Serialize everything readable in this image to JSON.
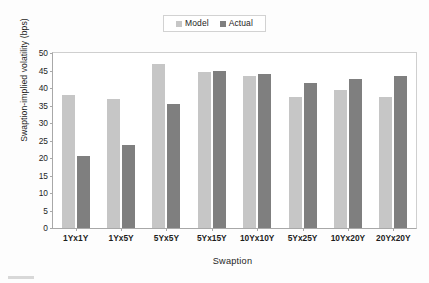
{
  "chart_data": {
    "type": "bar",
    "title": "",
    "xlabel": "Swaption",
    "ylabel": "Swaption-implied volatility (bps)",
    "categories": [
      "1Yx1Y",
      "1Yx5Y",
      "5Yx5Y",
      "5Yx15Y",
      "10Yx10Y",
      "5Yx25Y",
      "10Yx20Y",
      "20Yx20Y"
    ],
    "series": [
      {
        "name": "Model",
        "color": "#c6c6c6",
        "values": [
          38,
          36.8,
          47,
          44.5,
          43.5,
          37.5,
          39.5,
          37.5
        ]
      },
      {
        "name": "Actual",
        "color": "#7f7f7f",
        "values": [
          20.6,
          23.7,
          35.5,
          45,
          44,
          41.5,
          42.5,
          43.5
        ]
      }
    ],
    "ylim": [
      0,
      50
    ],
    "yticks": [
      50,
      45,
      40,
      35,
      30,
      25,
      20,
      15,
      10,
      5,
      0
    ],
    "ytick_labels": [
      "50",
      "45",
      "40",
      "35",
      "30",
      "25",
      "20",
      "15",
      "10",
      "5",
      "0"
    ],
    "grid": false,
    "legend_position": "top-center"
  },
  "legend": {
    "entries": [
      {
        "label": "Model",
        "color": "#c6c6c6"
      },
      {
        "label": "Actual",
        "color": "#7f7f7f"
      }
    ]
  },
  "axes": {
    "y_title": "Swaption-implied volatility (bps)",
    "x_title": "Swaption"
  }
}
